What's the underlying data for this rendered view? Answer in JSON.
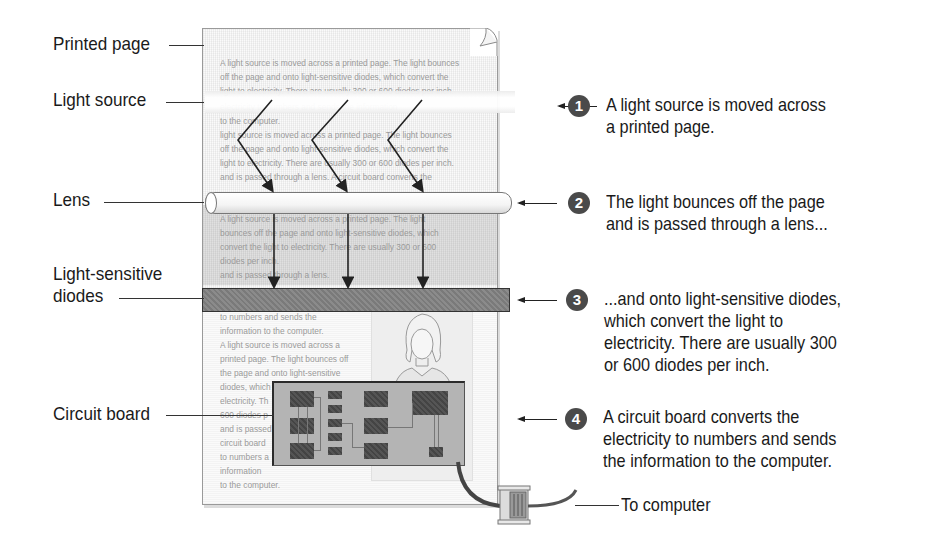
{
  "left_labels": {
    "printed_page": "Printed page",
    "light_source": "Light source",
    "lens": "Lens",
    "diodes_line1": "Light-sensitive",
    "diodes_line2": "diodes",
    "circuit_board": "Circuit board"
  },
  "page_text": {
    "top_lines": [
      "A light source is moved across a printed page. The light bounces",
      "off the page and onto light-sensitive diodes, which convert the",
      "light to electricity. There are usually 300 or 600 diodes per inch.",
      "electricity to numbers and sends the information",
      "to the computer.",
      " light source is moved across a printed page. The light bounces",
      "off the page and onto light-sensitive diodes, which convert the",
      "light to electricity. There are usually 300 or 600 diodes per inch.",
      "and is passed through a lens. A circuit board converts the"
    ],
    "middle_lines": [
      "A light source is moved across a printed page. The light",
      "bounces off the page and onto light-sensitive diodes, which",
      "convert the light to electricity. There are usually 300 or 600",
      "diodes per inch.",
      "and is passed through a lens."
    ],
    "bottom_lines": [
      "to numbers and sends the",
      "information to the computer.",
      "A light source is moved across a",
      "printed page. The light bounces off",
      "the page and onto light-sensitive",
      "diodes, which",
      "electricity. Th",
      "600 diodes p",
      "and is passed",
      "circuit board",
      "to numbers a",
      "information",
      "to the computer."
    ]
  },
  "steps": [
    {
      "number": "1",
      "lines": [
        "A light source is moved across",
        "a printed page."
      ]
    },
    {
      "number": "2",
      "lines": [
        "The light bounces off the page",
        "and is passed through a lens..."
      ]
    },
    {
      "number": "3",
      "lines": [
        "...and onto light-sensitive diodes,",
        "which convert the light to",
        "electricity. There are usually 300",
        "or 600 diodes per inch."
      ]
    },
    {
      "number": "4",
      "lines": [
        "A circuit board converts the",
        "electricity to numbers and sends",
        "the information to the computer."
      ]
    }
  ],
  "to_computer": "To computer",
  "colors": {
    "step_badge": "#4a4a4a",
    "text": "#1a1a1a",
    "page_text": "#9a9a9a",
    "circuit_board": "#b4b4b4",
    "chip": "#4d4d4d"
  }
}
